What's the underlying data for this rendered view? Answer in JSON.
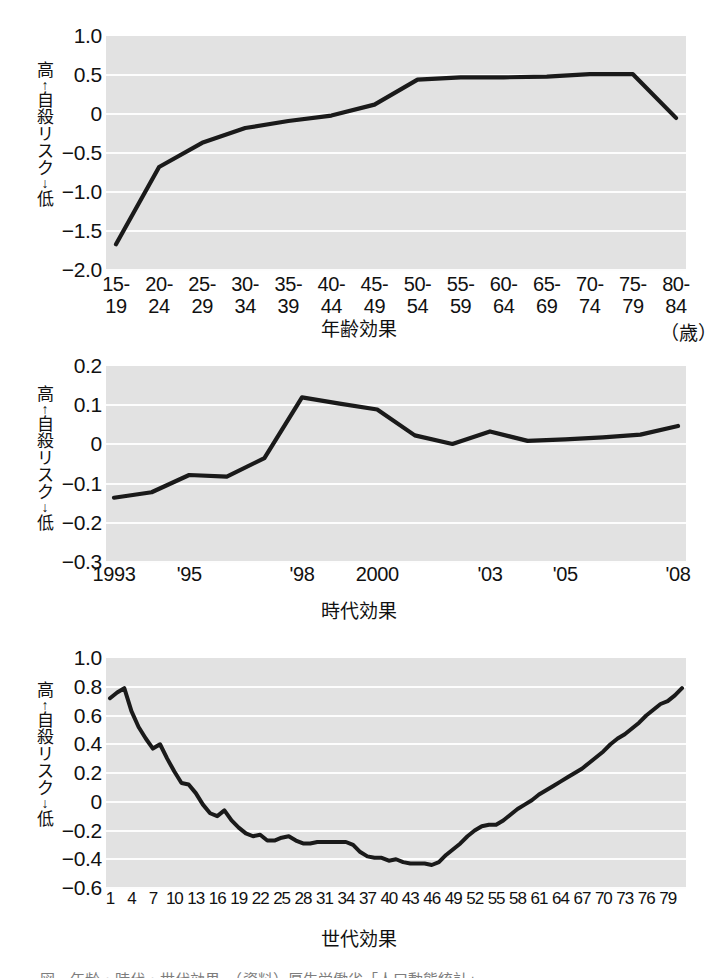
{
  "figure": {
    "vertical_axis_label": {
      "high": "高",
      "up_arrow": "↑",
      "text": "自殺リスク",
      "down_arrow": "↓",
      "low": "低"
    },
    "bottom_caption": "図　年齢・時代・世代効果　（資料）厚生労働省「人口動態統計」"
  },
  "chart_data": [
    {
      "id": "age-effect",
      "type": "line",
      "title": "",
      "xlabel": "年齢効果",
      "ylabel": "高 ↑ 自殺リスク ↓ 低",
      "unit_note": "（歳）",
      "categories": [
        "15-\n19",
        "20-\n24",
        "25-\n29",
        "30-\n34",
        "35-\n39",
        "40-\n44",
        "45-\n49",
        "50-\n54",
        "55-\n59",
        "60-\n64",
        "65-\n69",
        "70-\n74",
        "75-\n79",
        "80-\n84"
      ],
      "ytick_labels": [
        "1.0",
        "0.5",
        "0",
        "−0.5",
        "−1.0",
        "−1.5",
        "−2.0"
      ],
      "yticks": [
        1.0,
        0.5,
        0,
        -0.5,
        -1.0,
        -1.5,
        -2.0
      ],
      "ylim": [
        -2.0,
        1.0
      ],
      "values": [
        -1.67,
        -0.68,
        -0.37,
        -0.18,
        -0.09,
        -0.02,
        0.12,
        0.44,
        0.47,
        0.47,
        0.48,
        0.51,
        0.51,
        -0.05
      ],
      "grid": true,
      "legend": "none"
    },
    {
      "id": "period-effect",
      "type": "line",
      "title": "",
      "xlabel": "時代効果",
      "ylabel": "高 ↑ 自殺リスク ↓ 低",
      "x": [
        1993,
        1994,
        1995,
        1996,
        1997,
        1998,
        1999,
        2000,
        2001,
        2002,
        2003,
        2004,
        2005,
        2006,
        2007,
        2008
      ],
      "xtick_positions": [
        1993,
        1995,
        1998,
        2000,
        2003,
        2005,
        2008
      ],
      "xtick_labels": [
        "1993",
        "'95",
        "'98",
        "2000",
        "'03",
        "'05",
        "'08"
      ],
      "ytick_labels": [
        "0.2",
        "0.1",
        "0",
        "−0.1",
        "−0.2",
        "−0.3"
      ],
      "yticks": [
        0.2,
        0.1,
        0,
        -0.1,
        -0.2,
        -0.3
      ],
      "ylim": [
        -0.3,
        0.2
      ],
      "values": [
        -0.136,
        -0.122,
        -0.078,
        -0.082,
        -0.035,
        0.12,
        0.104,
        0.089,
        0.023,
        0.001,
        0.033,
        0.009,
        0.013,
        0.018,
        0.025,
        0.047
      ],
      "grid": true,
      "legend": "none"
    },
    {
      "id": "cohort-effect",
      "type": "line",
      "title": "",
      "xlabel": "世代効果",
      "ylabel": "高 ↑ 自殺リスク ↓ 低",
      "xtick_labels": [
        "1",
        "4",
        "7",
        "10",
        "13",
        "16",
        "19",
        "22",
        "25",
        "28",
        "31",
        "34",
        "37",
        "40",
        "43",
        "46",
        "49",
        "52",
        "55",
        "58",
        "61",
        "64",
        "67",
        "70",
        "73",
        "76",
        "79"
      ],
      "xtick_values": [
        1,
        4,
        7,
        10,
        13,
        16,
        19,
        22,
        25,
        28,
        31,
        34,
        37,
        40,
        43,
        46,
        49,
        52,
        55,
        58,
        61,
        64,
        67,
        70,
        73,
        76,
        79
      ],
      "ytick_labels": [
        "1.0",
        "0.8",
        "0.6",
        "0.4",
        "0.2",
        "0",
        "−0.2",
        "−0.4",
        "−0.6"
      ],
      "yticks": [
        1.0,
        0.8,
        0.6,
        0.4,
        0.2,
        0,
        -0.2,
        -0.4,
        -0.6
      ],
      "ylim": [
        -0.6,
        1.0
      ],
      "x": [
        1,
        2,
        3,
        4,
        5,
        6,
        7,
        8,
        9,
        10,
        11,
        12,
        13,
        14,
        15,
        16,
        17,
        18,
        19,
        20,
        21,
        22,
        23,
        24,
        25,
        26,
        27,
        28,
        29,
        30,
        31,
        32,
        33,
        34,
        35,
        36,
        37,
        38,
        39,
        40,
        41,
        42,
        43,
        44,
        45,
        46,
        47,
        48,
        49,
        50,
        51,
        52,
        53,
        54,
        55,
        56,
        57,
        58,
        59,
        60,
        61,
        62,
        63,
        64,
        65,
        66,
        67,
        68,
        69,
        70,
        71,
        72,
        73,
        74,
        75,
        76,
        77,
        78,
        79,
        80,
        81
      ],
      "values": [
        0.72,
        0.76,
        0.79,
        0.63,
        0.52,
        0.44,
        0.37,
        0.4,
        0.3,
        0.21,
        0.13,
        0.12,
        0.06,
        -0.02,
        -0.08,
        -0.1,
        -0.06,
        -0.13,
        -0.18,
        -0.22,
        -0.24,
        -0.23,
        -0.27,
        -0.27,
        -0.25,
        -0.24,
        -0.27,
        -0.29,
        -0.29,
        -0.28,
        -0.28,
        -0.28,
        -0.28,
        -0.28,
        -0.3,
        -0.35,
        -0.38,
        -0.39,
        -0.39,
        -0.41,
        -0.4,
        -0.42,
        -0.43,
        -0.43,
        -0.43,
        -0.44,
        -0.42,
        -0.37,
        -0.33,
        -0.29,
        -0.24,
        -0.2,
        -0.17,
        -0.16,
        -0.16,
        -0.13,
        -0.09,
        -0.05,
        -0.02,
        0.01,
        0.05,
        0.08,
        0.11,
        0.14,
        0.17,
        0.2,
        0.23,
        0.27,
        0.31,
        0.35,
        0.4,
        0.44,
        0.47,
        0.51,
        0.55,
        0.6,
        0.64,
        0.68,
        0.7,
        0.74,
        0.79
      ],
      "grid": true,
      "legend": "none"
    }
  ]
}
